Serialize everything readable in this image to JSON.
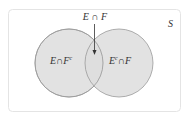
{
  "diagram": {
    "type": "venn",
    "universe_label": "S",
    "sets": [
      {
        "name": "E",
        "region_label": "E∩F",
        "complement_superscript": "c"
      },
      {
        "name": "F"
      }
    ],
    "labels": {
      "intersection_top": "E ∩ F",
      "left_only_main": "E∩F",
      "left_only_sup": "c",
      "right_only_pre": "E",
      "right_only_sup": "c",
      "right_only_post": "∩F",
      "universe": "S"
    },
    "colors": {
      "circle_fill": "#dddddd",
      "circle_stroke": "#9a9a9a",
      "border": "#e4e4e4",
      "text": "#333333",
      "arrow": "#333333"
    }
  }
}
